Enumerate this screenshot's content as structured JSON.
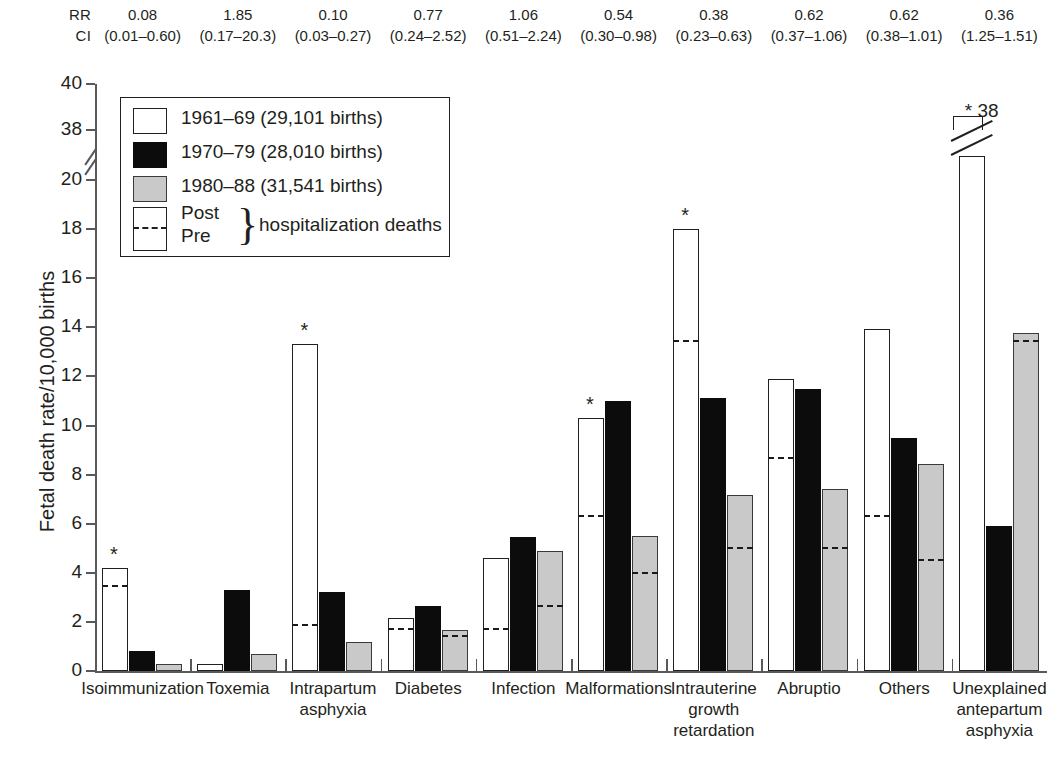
{
  "chart_data": {
    "type": "bar",
    "title": "",
    "xlabel": "",
    "ylabel": "Fetal death rate/10,000 births",
    "ylim": [
      0,
      40
    ],
    "y_ticks": [
      0,
      2,
      4,
      6,
      8,
      10,
      12,
      14,
      16,
      18,
      20,
      38,
      40
    ],
    "y_axis_break": {
      "between": [
        20,
        38
      ],
      "note": "axis break drawn between 20 and 38"
    },
    "grid": false,
    "legend_position": "upper-left inside axes",
    "categories": [
      "Isoimmunization",
      "Toxemia",
      "Intrapartum asphyxia",
      "Diabetes",
      "Infection",
      "Malformations",
      "Intrauterine growth retardation",
      "Abruptio",
      "Others",
      "Unexplained antepartum asphyxia"
    ],
    "series": [
      {
        "name": "1961–69 (29,101 births)",
        "fill": "white",
        "values": [
          4.2,
          0.3,
          13.3,
          2.15,
          4.6,
          10.3,
          18.0,
          11.9,
          13.95,
          38.0
        ],
        "pre_hospitalization": [
          3.5,
          null,
          1.9,
          1.75,
          1.75,
          6.35,
          13.5,
          8.7,
          6.35,
          null
        ]
      },
      {
        "name": "1970–79 (28,010 births)",
        "fill": "black",
        "values": [
          0.8,
          3.3,
          3.2,
          2.65,
          5.45,
          11.0,
          11.1,
          11.5,
          9.5,
          20.8
        ],
        "pre_hospitalization": [
          null,
          null,
          null,
          null,
          null,
          null,
          null,
          null,
          null,
          null
        ]
      },
      {
        "name": "1980–88 (31,541 births)",
        "fill": "gray",
        "values": [
          0.3,
          0.7,
          1.2,
          1.65,
          4.9,
          5.5,
          7.15,
          7.4,
          8.45,
          13.75
        ],
        "pre_hospitalization": [
          null,
          null,
          null,
          1.45,
          2.7,
          4.05,
          5.05,
          5.05,
          4.55,
          13.5
        ]
      }
    ],
    "significance_markers": [
      {
        "category": "Isoimmunization",
        "series": "1961–69 (29,101 births)",
        "marker": "*"
      },
      {
        "category": "Intrapartum asphyxia",
        "series": "1961–69 (29,101 births)",
        "marker": "*"
      },
      {
        "category": "Malformations",
        "series": "1961–69 (29,101 births)",
        "marker": "*"
      },
      {
        "category": "Intrauterine growth retardation",
        "series": "1961–69 (29,101 births)",
        "marker": "*"
      },
      {
        "category": "Unexplained antepartum asphyxia",
        "series": "1961–69 (29,101 births)",
        "marker": "* 38"
      }
    ],
    "broken_bar": {
      "category": "Unexplained antepartum asphyxia",
      "series": "1961–69 (29,101 births)",
      "true_value": 38.0,
      "label": "* 38"
    },
    "annotations": {
      "rr_label": "RR",
      "ci_label": "CI",
      "rr": [
        "0.08",
        "1.85",
        "0.10",
        "0.77",
        "1.06",
        "0.54",
        "0.38",
        "0.62",
        "0.62",
        "0.36"
      ],
      "ci": [
        "(0.01–0.60)",
        "(0.17–20.3)",
        "(0.03–0.27)",
        "(0.24–2.52)",
        "(0.51–2.24)",
        "(0.30–0.98)",
        "(0.23–0.63)",
        "(0.37–1.06)",
        "(0.38–1.01)",
        "(1.25–1.51)"
      ]
    },
    "legend": {
      "entries": [
        "1961–69 (29,101 births)",
        "1970–79 (28,010 births)",
        "1980–88 (31,541 births)"
      ],
      "post_label": "Post",
      "pre_label": "Pre",
      "brace_glyph": "}",
      "hospitalization_label": "hospitalization deaths"
    },
    "x_tick_labels": [
      [
        "Isoimmunization"
      ],
      [
        "Toxemia"
      ],
      [
        "Intrapartum",
        "asphyxia"
      ],
      [
        "Diabetes"
      ],
      [
        "Infection"
      ],
      [
        "Malformations"
      ],
      [
        "Intrauterine",
        "growth",
        "retardation"
      ],
      [
        "Abruptio"
      ],
      [
        "Others"
      ],
      [
        "Unexplained",
        "antepartum",
        "asphyxia"
      ]
    ],
    "colors": {
      "series_1": "#ffffff",
      "series_2": "#0c0c0c",
      "series_3": "#c9c9c9",
      "outline": "#231f20",
      "axis": "#58595b"
    }
  }
}
